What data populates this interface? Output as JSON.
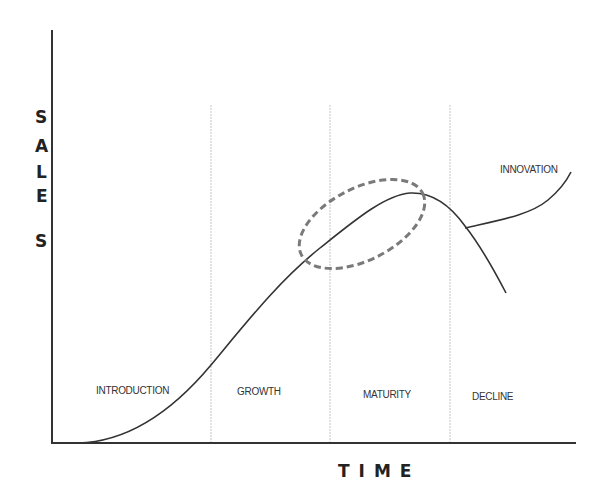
{
  "diagram": {
    "y_axis_label": "SALES",
    "y_axis_letters": [
      "S",
      "A",
      "L",
      "E",
      "S"
    ],
    "x_axis_label": "TIME",
    "stages": [
      {
        "label": "INTRODUCTION"
      },
      {
        "label": "GROWTH"
      },
      {
        "label": "MATURITY"
      },
      {
        "label": "DECLINE"
      }
    ],
    "branch_label": "INNOVATION",
    "highlight": "dashed ellipse around late growth / maturity peak",
    "colors": {
      "axis": "#333333",
      "curve": "#333333",
      "divider": "#bbbbbb",
      "highlight": "#777777",
      "text": "#333333"
    }
  }
}
